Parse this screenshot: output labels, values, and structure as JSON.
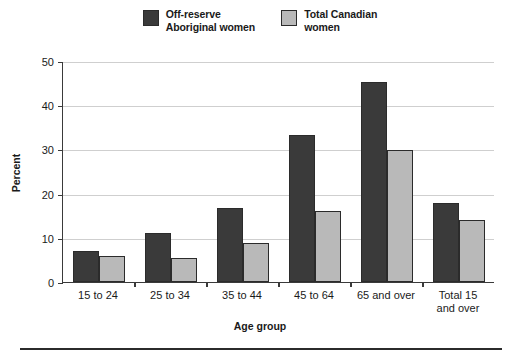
{
  "chart_data": {
    "type": "bar",
    "title": "",
    "subtitle": "",
    "xlabel": "Age group",
    "ylabel": "Percent",
    "categories": [
      "15 to 24",
      "25 to 34",
      "35 to 44",
      "45 to 64",
      "65 and over",
      "Total 15\nand over"
    ],
    "series": [
      {
        "name": "Off-reserve\nAboriginal women",
        "color": "#3a3a3a",
        "values": [
          7,
          11,
          16.7,
          33.2,
          45.2,
          17.8
        ]
      },
      {
        "name": "Total Canadian\nwomen",
        "color": "#b9b9b9",
        "values": [
          5.9,
          5.5,
          8.8,
          16,
          29.8,
          14
        ]
      }
    ],
    "ylim": [
      0,
      50
    ],
    "yticks": [
      0,
      10,
      20,
      30,
      40,
      50
    ],
    "ytick_labels": [
      "0",
      "10",
      "20",
      "30",
      "40",
      "50"
    ],
    "grid": "horizontal",
    "legend_position": "top-center"
  },
  "legend": {
    "entries": [
      {
        "label": "Off-reserve\nAboriginal women",
        "swatch_color": "#3a3a3a"
      },
      {
        "label": "Total Canadian\nwomen",
        "swatch_color": "#b9b9b9"
      }
    ]
  },
  "axes": {
    "y_title": "Percent",
    "x_title": "Age group"
  }
}
